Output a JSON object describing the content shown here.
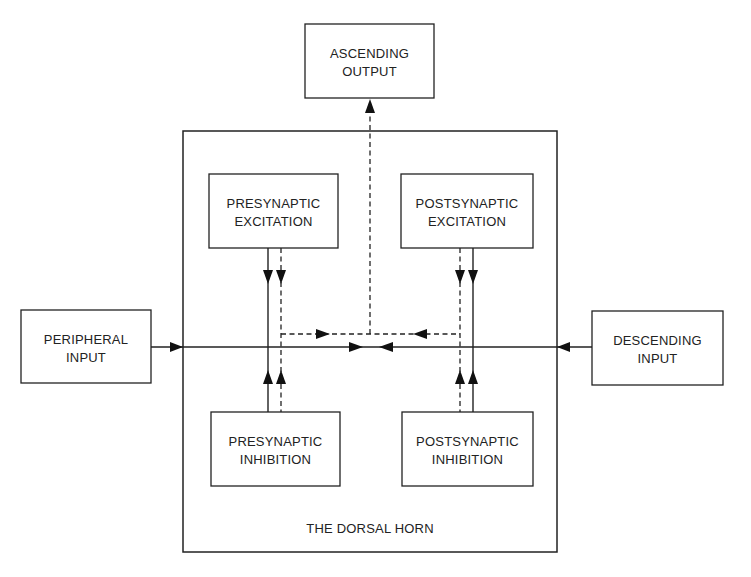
{
  "diagram": {
    "title": "THE DORSAL HORN",
    "colors": {
      "stroke": "#222222",
      "background": "#ffffff"
    },
    "outer_box": {
      "label": "THE DORSAL HORN",
      "x": 183,
      "y": 131,
      "w": 374,
      "h": 421
    },
    "boxes": [
      {
        "id": "ascending-output",
        "lines": [
          "ASCENDING",
          "OUTPUT"
        ],
        "x": 305,
        "y": 24,
        "w": 129,
        "h": 74
      },
      {
        "id": "presynaptic-excitation",
        "lines": [
          "PRESYNAPTIC",
          "EXCITATION"
        ],
        "x": 209,
        "y": 174,
        "w": 129,
        "h": 74
      },
      {
        "id": "postsynaptic-excitation",
        "lines": [
          "POSTSYNAPTIC",
          "EXCITATION"
        ],
        "x": 401,
        "y": 174,
        "w": 132,
        "h": 74
      },
      {
        "id": "peripheral-input",
        "lines": [
          "PERIPHERAL",
          "INPUT"
        ],
        "x": 21,
        "y": 310,
        "w": 130,
        "h": 73
      },
      {
        "id": "descending-input",
        "lines": [
          "DESCENDING",
          "INPUT"
        ],
        "x": 592,
        "y": 311,
        "w": 131,
        "h": 74
      },
      {
        "id": "presynaptic-inhibition",
        "lines": [
          "PRESYNAPTIC",
          "INHIBITION"
        ],
        "x": 211,
        "y": 412,
        "w": 129,
        "h": 74
      },
      {
        "id": "postsynaptic-inhibition",
        "lines": [
          "POSTSYNAPTIC",
          "INHIBITION"
        ],
        "x": 402,
        "y": 412,
        "w": 131,
        "h": 74
      }
    ],
    "connections": [
      {
        "from": "peripheral-input",
        "to": "dorsal-horn",
        "style": "solid"
      },
      {
        "from": "descending-input",
        "to": "dorsal-horn",
        "style": "solid"
      },
      {
        "from": "presynaptic-excitation",
        "to": "main-line",
        "style": "solid+dashed"
      },
      {
        "from": "postsynaptic-excitation",
        "to": "main-line",
        "style": "solid+dashed"
      },
      {
        "from": "presynaptic-inhibition",
        "to": "main-line",
        "style": "solid+dashed"
      },
      {
        "from": "postsynaptic-inhibition",
        "to": "main-line",
        "style": "solid+dashed"
      },
      {
        "from": "dorsal-horn",
        "to": "ascending-output",
        "style": "dashed"
      }
    ]
  }
}
